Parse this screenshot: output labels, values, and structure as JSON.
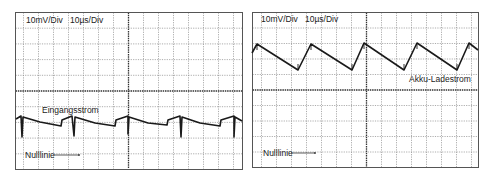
{
  "chart_data": [
    {
      "type": "line",
      "title": "Eingangsstrom",
      "settings": {
        "vertical_scale": "10mV/Div",
        "time_scale": "10µs/Div"
      },
      "grid": {
        "on": true,
        "rows": 10,
        "cols": 15
      },
      "series": [
        {
          "name": "Eingangsstrom",
          "points": [
            [
              16,
              119
            ],
            [
              21,
              116
            ],
            [
              22,
              137
            ],
            [
              23,
              117
            ],
            [
              40,
              122
            ],
            [
              61,
              126
            ],
            [
              62,
              120
            ],
            [
              72,
              116
            ],
            [
              74,
              136
            ],
            [
              75,
              117
            ],
            [
              95,
              123
            ],
            [
              115,
              126
            ],
            [
              116,
              120
            ],
            [
              128,
              116
            ],
            [
              128,
              134
            ],
            [
              129,
              117
            ],
            [
              148,
              123
            ],
            [
              167,
              125
            ],
            [
              168,
              120
            ],
            [
              180,
              116
            ],
            [
              181,
              137
            ],
            [
              182,
              117
            ],
            [
              200,
              123
            ],
            [
              220,
              126
            ],
            [
              221,
              120
            ],
            [
              234,
              116
            ],
            [
              234,
              137
            ],
            [
              235,
              117
            ],
            [
              242,
              121
            ]
          ]
        }
      ],
      "annotations": [
        "Eingangsstrom",
        "Nulllinie"
      ],
      "legend": "none"
    },
    {
      "type": "line",
      "title": "Akku-Ladestrom",
      "settings": {
        "vertical_scale": "10mV/Div",
        "time_scale": "10µs/Div"
      },
      "grid": {
        "on": true,
        "rows": 10,
        "cols": 15
      },
      "series": [
        {
          "name": "Akku-Ladestrom",
          "points": [
            [
              252,
              53
            ],
            [
              257,
              44
            ],
            [
              298,
              70
            ],
            [
              311,
              44
            ],
            [
              352,
              70
            ],
            [
              364,
              43
            ],
            [
              404,
              70
            ],
            [
              417,
              43
            ],
            [
              457,
              70
            ],
            [
              469,
              43
            ],
            [
              478,
              50
            ]
          ]
        }
      ],
      "annotations": [
        "Akku-Ladestrom",
        "Nulllinie"
      ],
      "legend": "none"
    }
  ],
  "left_panel": {
    "volts_per_div": "10mV/Div",
    "time_per_div": "10µs/Div",
    "trace_label": "Eingangsstrom",
    "zero_label": "Nulllinie"
  },
  "right_panel": {
    "volts_per_div": "10mV/Div",
    "time_per_div": "10µs/Div",
    "trace_label": "Akku-Ladestrom",
    "zero_label": "Nulllinie"
  },
  "colors": {
    "trace": "#1a1a1a",
    "grid": "#8a8a8a",
    "background": "#ffffff"
  }
}
